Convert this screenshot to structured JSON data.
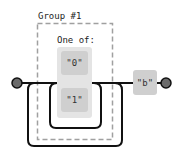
{
  "diagram": {
    "type": "railroad",
    "group": {
      "label": "Group #1"
    },
    "choice": {
      "label": "One of:",
      "options": [
        {
          "literal": "\"0\""
        },
        {
          "literal": "\"1\""
        }
      ]
    },
    "after": {
      "literal": "\"b\""
    },
    "colors": {
      "line": "#111111",
      "terminal": "#6b6b6b",
      "group_border": "#a0a0a0",
      "choice_bg": "#e4e4e4",
      "literal_bg": "#cfcfcf"
    }
  }
}
